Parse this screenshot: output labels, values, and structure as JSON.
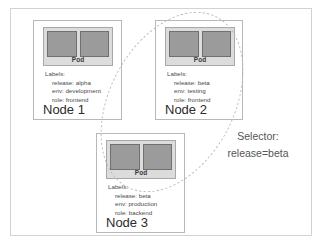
{
  "diagram": {
    "frame_border_color": "#d2d2d2",
    "pod_fill_color": "#9b9b9b",
    "pod_container_color": "#dcdcdc"
  },
  "nodes": [
    {
      "id": "node-1",
      "title": "Node 1",
      "pod_label": "Pod",
      "labels_heading": "Labels:",
      "labels": [
        "release: alpha",
        "env: development",
        "role: frontend"
      ]
    },
    {
      "id": "node-2",
      "title": "Node 2",
      "pod_label": "Pod",
      "labels_heading": "Labels:",
      "labels": [
        "release: beta",
        "env: testing",
        "role: frontend"
      ]
    },
    {
      "id": "node-3",
      "title": "Node 3",
      "pod_label": "Pod",
      "labels_heading": "Labels:",
      "labels": [
        "release: beta",
        "env: production",
        "role: backend"
      ]
    }
  ],
  "selector": {
    "heading": "Selector:",
    "expression": "release=beta"
  }
}
